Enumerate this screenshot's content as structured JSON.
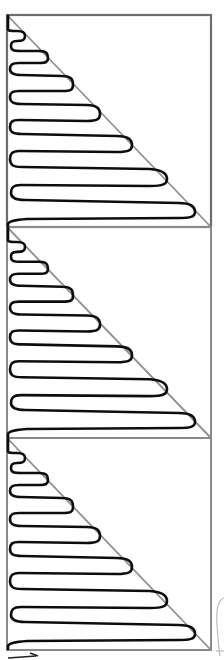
{
  "diagram": {
    "panel_count": 3,
    "panels": [
      {
        "id": "panel-1",
        "top": 15,
        "bottom": 227
      },
      {
        "id": "panel-2",
        "top": 227,
        "bottom": 438
      },
      {
        "id": "panel-3",
        "top": 438,
        "bottom": 650
      }
    ],
    "frame": {
      "left": 7,
      "right": 211
    },
    "serpentine_folds": 8,
    "colors": {
      "frame": "#8a8a8a",
      "diagonal": "#8f8f8f",
      "serpentine": "#0d0d0d",
      "background": "#ffffff"
    },
    "annotations": {
      "bottom_left": "arrow-stub",
      "bottom_right": "cropped-curve"
    }
  }
}
